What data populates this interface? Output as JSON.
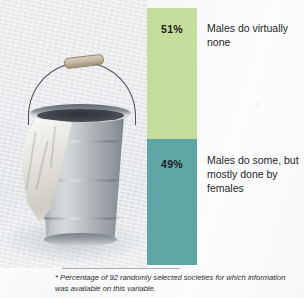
{
  "figure": {
    "name": "male-participation-in-task-stacked-bar",
    "background_color": "#fbfbfc"
  },
  "photo": {
    "alt_name": "metal-bucket-photograph",
    "subject": "galvanized metal bucket with wooden grip handle and white cloth draped over rim",
    "parts": {
      "bucket": "bucket",
      "rim": "bucket-rim",
      "handle": "bucket-handle",
      "grip": "handle-grip",
      "cloth": "draped-cloth",
      "shadow": "floor-shadow"
    }
  },
  "chart_data": {
    "type": "bar",
    "orientation": "vertical-stacked",
    "title": "",
    "xlabel": "",
    "ylabel": "",
    "ylim": [
      0,
      100
    ],
    "grid": false,
    "legend_position": "right-of-bar-inline",
    "categories": [
      "Males do virtually none",
      "Males do some, but mostly done by females"
    ],
    "values": [
      51,
      49
    ],
    "value_labels": [
      "51%",
      "49%"
    ],
    "colors": [
      "#c6dc9c",
      "#5fa5a5"
    ],
    "segments": [
      {
        "label": "Males do virtually none",
        "value": 51,
        "value_label": "51%",
        "color": "#c6dc9c",
        "order": "top"
      },
      {
        "label": "Males do some, but mostly done by females",
        "value": 49,
        "value_label": "49%",
        "color": "#5fa5a5",
        "order": "bottom"
      }
    ],
    "annotations": [
      "* Percentage of 92 randomly selected societies for which information was available on this variable."
    ]
  },
  "footnote": {
    "text": "* Percentage of 92 randomly selected societies for which information was available on this variable."
  }
}
